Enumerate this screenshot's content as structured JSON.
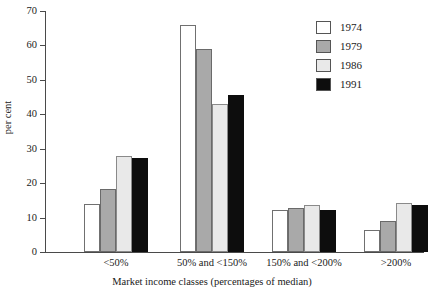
{
  "chart_data": {
    "type": "bar",
    "title": "",
    "xlabel": "Market income classes (percentages of median)",
    "ylabel": "per cent",
    "categories": [
      "<50%",
      "50% and <150%",
      "150% and <200%",
      ">200%"
    ],
    "series": [
      {
        "name": "1974",
        "color": "#ffffff",
        "values": [
          14.0,
          66.0,
          12.3,
          6.5
        ]
      },
      {
        "name": "1979",
        "color": "#a9a9a9",
        "values": [
          18.3,
          59.0,
          12.7,
          9.0
        ]
      },
      {
        "name": "1986",
        "color": "#e9e9e9",
        "values": [
          28.0,
          43.0,
          13.8,
          14.2
        ]
      },
      {
        "name": "1991",
        "color": "#0d0d0d",
        "values": [
          27.2,
          45.6,
          12.3,
          13.8
        ]
      }
    ],
    "ylim": [
      0,
      70
    ],
    "yticks": [
      0,
      10,
      20,
      30,
      40,
      50,
      60,
      70
    ],
    "ytick_labels": [
      "0",
      "10",
      "20",
      "30",
      "40",
      "50",
      "60",
      "70"
    ],
    "grid": false,
    "legend_position": "top-right",
    "legend_entries": [
      "1974",
      "1979",
      "1986",
      "1991"
    ]
  },
  "axes": {
    "y_title": "per cent",
    "x_title": "Market income classes (percentages of median)"
  }
}
